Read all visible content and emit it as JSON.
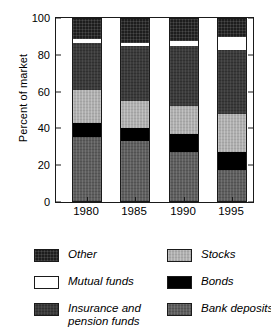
{
  "chart_data": {
    "type": "bar",
    "subtype": "stacked-bar-100",
    "title": "",
    "xlabel": "",
    "ylabel": "Percent of market",
    "categories": [
      "1980",
      "1985",
      "1990",
      "1995"
    ],
    "ylim": [
      0,
      100
    ],
    "yticks": [
      0,
      20,
      40,
      60,
      80,
      100
    ],
    "ytick_labels": [
      "0",
      "20",
      "40",
      "60",
      "80",
      "100"
    ],
    "grid": false,
    "legend_position": "bottom",
    "stack_order_bottom_to_top": [
      "Bank deposits",
      "Bonds",
      "Stocks",
      "Insurance and pension funds",
      "Mutual funds",
      "Other"
    ],
    "series": [
      {
        "name": "Bank deposits",
        "key": "bank",
        "color": "#5e5e5e",
        "values": [
          35,
          33,
          27,
          17
        ]
      },
      {
        "name": "Bonds",
        "key": "bonds",
        "color": "#000000",
        "values": [
          8,
          7,
          10,
          10
        ]
      },
      {
        "name": "Stocks",
        "key": "stocks",
        "color": "#aeaeae",
        "values": [
          18,
          15,
          15,
          21
        ]
      },
      {
        "name": "Insurance and pension funds",
        "key": "insurance",
        "color": "#3b3b3b",
        "values": [
          26,
          30,
          33,
          35
        ]
      },
      {
        "name": "Mutual funds",
        "key": "mutual",
        "color": "#ffffff",
        "values": [
          2,
          2,
          3,
          7
        ]
      },
      {
        "name": "Other",
        "key": "other",
        "color": "#1d1d1d",
        "values": [
          11,
          13,
          12,
          10
        ]
      }
    ]
  },
  "axis": {
    "ylabel": "Percent of market",
    "ytick_labels": [
      "100",
      "80",
      "60",
      "40",
      "20",
      "0"
    ],
    "xtick_labels": [
      "1980",
      "1985",
      "1990",
      "1995"
    ]
  },
  "legend": {
    "left_column": [
      {
        "label": "Other",
        "key": "other"
      },
      {
        "label": "Mutual funds",
        "key": "mutual"
      },
      {
        "label": "Insurance and\npension funds",
        "key": "insurance"
      }
    ],
    "right_column": [
      {
        "label": "Stocks",
        "key": "stocks"
      },
      {
        "label": "Bonds",
        "key": "bonds"
      },
      {
        "label": "Bank deposits",
        "key": "bank"
      }
    ]
  }
}
